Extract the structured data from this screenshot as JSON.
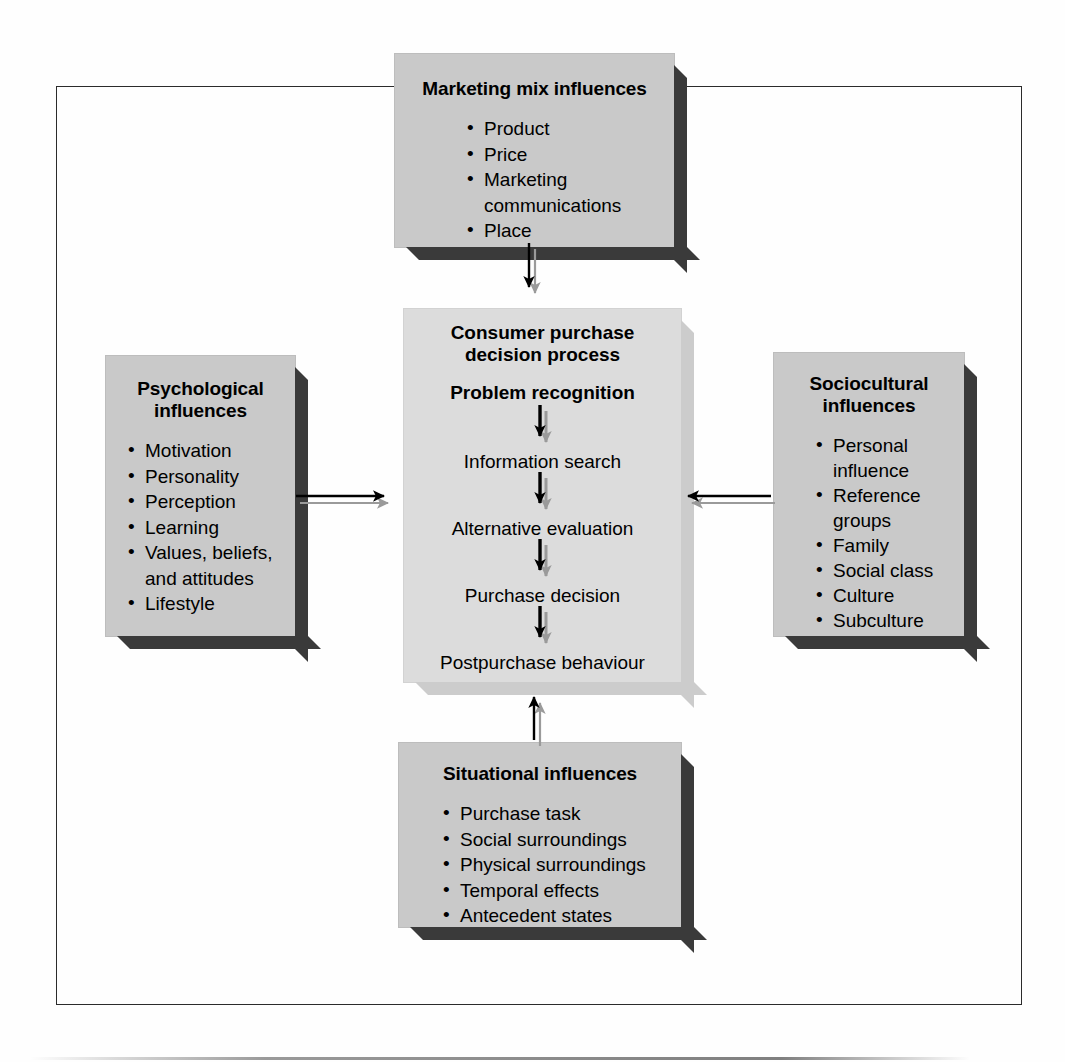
{
  "figure": {
    "kind": "influences-on-consumer-purchase-decision-process-diagram"
  },
  "boxes": {
    "marketing_mix": {
      "title": "Marketing mix influences",
      "items": [
        "Product",
        "Price",
        "Marketing\ncommunications",
        "Place"
      ]
    },
    "psychological": {
      "title": "Psychological\ninfluences",
      "items": [
        "Motivation",
        "Personality",
        "Perception",
        "Learning",
        "Values, beliefs,",
        "and attitudes",
        "Lifestyle"
      ]
    },
    "sociocultural": {
      "title": "Sociocultural\ninfluences",
      "items": [
        "Personal",
        "influence",
        "Reference",
        "groups",
        "Family",
        "Social class",
        "Culture",
        "Subculture"
      ]
    },
    "situational": {
      "title": "Situational influences",
      "items": [
        "Purchase task",
        "Social surroundings",
        "Physical surroundings",
        "Temporal effects",
        "Antecedent states"
      ]
    },
    "centre": {
      "title_line1": "Consumer purchase",
      "title_line2": "decision process",
      "steps": [
        "Problem recognition",
        "Information search",
        "Alternative evaluation",
        "Purchase decision",
        "Postpurchase behaviour"
      ]
    }
  },
  "colors": {
    "box_fill": "#c9c9c9",
    "centre_fill": "#dcdcdc",
    "box_shadow": "#3a3a3a",
    "centre_shadow": "#cccccc",
    "arrow": "#000000",
    "arrow_shadow": "#9a9a9a",
    "frame": "#2b2b2b"
  },
  "arrows": [
    {
      "name": "marketing-mix-to-centre",
      "direction": "down"
    },
    {
      "name": "psychological-to-centre",
      "direction": "right"
    },
    {
      "name": "sociocultural-to-centre",
      "direction": "left"
    },
    {
      "name": "situational-to-centre",
      "direction": "up"
    },
    {
      "name": "problem-recognition-to-information-search",
      "direction": "down"
    },
    {
      "name": "information-search-to-alternative-evaluation",
      "direction": "down"
    },
    {
      "name": "alternative-evaluation-to-purchase-decision",
      "direction": "down"
    },
    {
      "name": "purchase-decision-to-postpurchase-behaviour",
      "direction": "down"
    }
  ]
}
